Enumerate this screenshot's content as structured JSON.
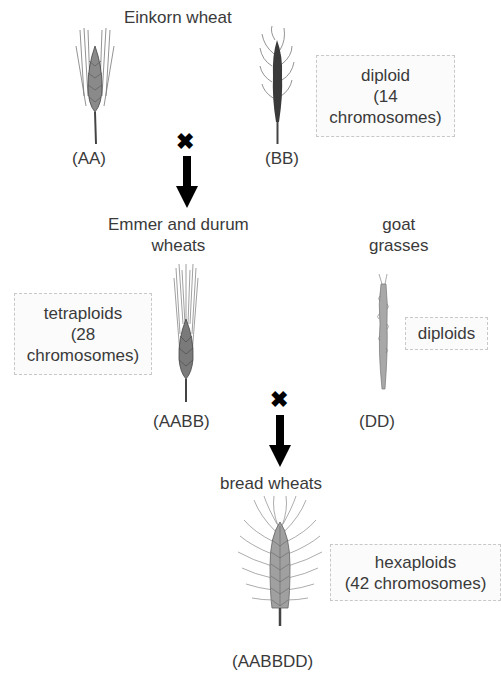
{
  "title": "Einkorn wheat",
  "row1": {
    "spike_a": {
      "label": "(AA)"
    },
    "spike_b": {
      "label": "(BB)"
    },
    "ploidy_box": {
      "line1": "diploid",
      "line2": "(14",
      "line3": "chromosomes)"
    },
    "cross_symbol": "✖"
  },
  "row2": {
    "emmer": {
      "title_line1": "Emmer and durum",
      "title_line2": "wheats",
      "label": "(AABB)"
    },
    "goat": {
      "title_line1": "goat",
      "title_line2": "grasses",
      "label": "(DD)"
    },
    "tetra_box": {
      "line1": "tetraploids",
      "line2": "(28",
      "line3": "chromosomes)"
    },
    "diploid_box": {
      "line1": "diploids"
    },
    "cross_symbol": "✖"
  },
  "row3": {
    "title": "bread wheats",
    "label": "(AABBDD)",
    "hexa_box": {
      "line1": "hexaploids",
      "line2": "(42 chromosomes)"
    }
  },
  "colors": {
    "text": "#3a3a3a",
    "box_border": "#c8c8c8",
    "arrow": "#000000",
    "spike_fill": "#9a9a9a",
    "spike_dark": "#3c3c3c"
  }
}
